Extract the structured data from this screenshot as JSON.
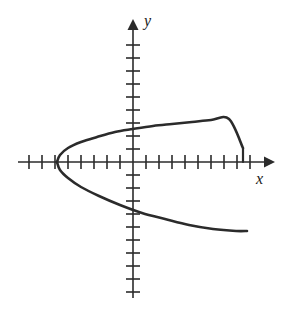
{
  "figure": {
    "width": 294,
    "height": 310,
    "background": "#ffffff",
    "ink_color": "#2b2b2b",
    "curve_color": "#2b2b2b"
  },
  "axes": {
    "x_label": "x",
    "y_label": "y",
    "origin_px": [
      133,
      162
    ],
    "tick_spacing_px": 13,
    "x_axis": {
      "start_px": 18,
      "end_px": 272,
      "arrow": "right",
      "tick_count_left": 8,
      "tick_count_right": 9
    },
    "y_axis": {
      "start_px": 22,
      "end_px": 298,
      "arrow": "up",
      "tick_count_above": 10,
      "tick_count_below": 10
    }
  },
  "chart_data": {
    "type": "line",
    "title": "",
    "xlabel": "x",
    "ylabel": "y",
    "grid": false,
    "legend": null,
    "xlim": [
      -8.8,
      10.7
    ],
    "ylim": [
      -10.8,
      10.8
    ],
    "series": [
      {
        "name": "parabola-upper-branch",
        "points_data": [
          [
            -5.85,
            0.0
          ],
          [
            -5.6,
            0.55
          ],
          [
            -5.0,
            1.05
          ],
          [
            -4.0,
            1.55
          ],
          [
            -2.8,
            1.95
          ],
          [
            -1.4,
            2.3
          ],
          [
            0.0,
            2.55
          ],
          [
            1.5,
            2.75
          ],
          [
            3.0,
            2.95
          ],
          [
            4.5,
            3.1
          ],
          [
            6.0,
            3.2
          ],
          [
            7.4,
            3.3
          ],
          [
            8.45,
            3.35
          ]
        ],
        "points_px": [
          [
            57,
            162
          ],
          [
            60,
            155
          ],
          [
            68,
            148
          ],
          [
            81,
            142
          ],
          [
            97,
            137
          ],
          [
            115,
            132
          ],
          [
            133,
            129
          ],
          [
            153,
            126
          ],
          [
            172,
            124
          ],
          [
            192,
            122
          ],
          [
            211,
            120
          ],
          [
            229,
            119
          ],
          [
            243,
            148
          ]
        ]
      },
      {
        "name": "parabola-lower-branch",
        "points_data": [
          [
            -5.85,
            0.0
          ],
          [
            -5.6,
            -0.6
          ],
          [
            -5.0,
            -1.2
          ],
          [
            -4.0,
            -1.9
          ],
          [
            -2.6,
            -2.65
          ],
          [
            -1.0,
            -3.35
          ],
          [
            0.7,
            -3.95
          ],
          [
            2.5,
            -4.45
          ],
          [
            4.3,
            -4.85
          ],
          [
            6.2,
            -5.15
          ],
          [
            8.0,
            -5.35
          ],
          [
            8.8,
            -5.4
          ]
        ],
        "points_px": [
          [
            57,
            162
          ],
          [
            60,
            170
          ],
          [
            68,
            178
          ],
          [
            81,
            187
          ],
          [
            99,
            196
          ],
          [
            120,
            205
          ],
          [
            142,
            213
          ],
          [
            165,
            219
          ],
          [
            189,
            225
          ],
          [
            213,
            229
          ],
          [
            236,
            231
          ],
          [
            247,
            231
          ]
        ]
      },
      {
        "name": "upper-branch-end-drop",
        "points_data": [
          [
            8.45,
            3.35
          ],
          [
            8.45,
            0.0
          ]
        ],
        "points_px": [
          [
            243,
            148
          ],
          [
            243,
            162
          ]
        ]
      }
    ],
    "vertex_px": [
      57,
      196
    ],
    "vertex_data": [
      -5.85,
      -2.6
    ]
  }
}
